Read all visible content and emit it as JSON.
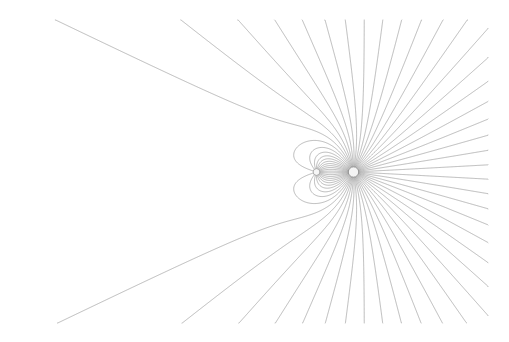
{
  "diagram": {
    "type": "electric-field-lines",
    "canvas": {
      "width": 509,
      "height": 342,
      "background": "#ffffff"
    },
    "clip_box": {
      "x0": 26,
      "y0": 20,
      "x1": 488,
      "y1": 323
    },
    "line_color": "#9a9a9a",
    "line_opacity": 0.75,
    "line_width": 0.9,
    "charges": [
      {
        "name": "large-charge",
        "x": 353.5,
        "y": 172,
        "q": 4.0,
        "radius": 5.2,
        "fill": "#f4f4f4",
        "stroke": "#7a7a7a"
      },
      {
        "name": "small-charge",
        "x": 316.5,
        "y": 172,
        "q": -1.0,
        "radius": 3.4,
        "fill": "#f6f6f6",
        "stroke": "#9a9a9a"
      }
    ],
    "source_charge_index": 0,
    "line_count": 64
  }
}
